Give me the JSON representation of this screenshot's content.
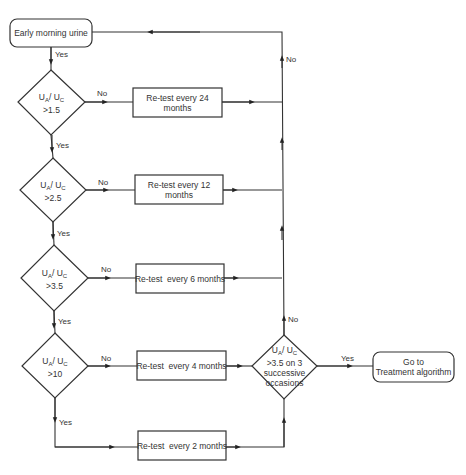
{
  "start": {
    "label": "Early morning urine"
  },
  "decisions": [
    {
      "var_a": "U",
      "sub_a": "A",
      "var_b": "U",
      "sub_b": "C",
      "threshold": ">1.5"
    },
    {
      "var_a": "U",
      "sub_a": "A",
      "var_b": "U",
      "sub_b": "C",
      "threshold": ">2.5"
    },
    {
      "var_a": "U",
      "sub_a": "A",
      "var_b": "U",
      "sub_b": "C",
      "threshold": ">3.5"
    },
    {
      "var_a": "U",
      "sub_a": "A",
      "var_b": "U",
      "sub_b": "C",
      "threshold": ">10"
    }
  ],
  "retests": [
    {
      "label": "Re-test every 24 months"
    },
    {
      "label": "Re-test every 12 months"
    },
    {
      "label": "Re-test  every 6 months"
    },
    {
      "label": "Re-test  every 4 months"
    },
    {
      "label": "Re-test  every 2 months"
    }
  ],
  "final_decision": {
    "var_a": "U",
    "sub_a": "A",
    "var_b": "U",
    "sub_b": "C",
    "line2": ">3.5 on 3",
    "line3": "successive",
    "line4": "occasions"
  },
  "end": {
    "line1": "Go to",
    "line2": "Treatment algorithm"
  },
  "edge_labels": {
    "yes": "Yes",
    "no": "No"
  }
}
